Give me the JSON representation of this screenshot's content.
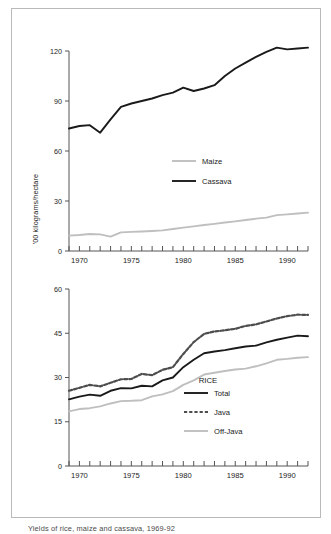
{
  "figure": {
    "ylabel": "'00 kilograms/hectare",
    "caption": "Yields of rice, maize and cassava, 1969-92",
    "border_color": "#b9b9b9",
    "background": "#ffffff"
  },
  "colors": {
    "black": "#1a1a1a",
    "dark_gray": "#4d4d4d",
    "light_gray": "#bfbfbf",
    "axis": "#555555",
    "text": "#222222"
  },
  "chart_data": [
    {
      "type": "line",
      "title": "",
      "xlabel": "",
      "ylabel": "'00 kilograms/hectare",
      "xlim": [
        1969,
        1992
      ],
      "ylim": [
        0,
        120
      ],
      "yticks": [
        0,
        30,
        60,
        90,
        120
      ],
      "xticks_major": [
        1970,
        1975,
        1980,
        1985,
        1990
      ],
      "xticks_minor_step": 1,
      "grid": false,
      "legend_position": "center-right",
      "x": [
        1969,
        1970,
        1971,
        1972,
        1973,
        1974,
        1975,
        1976,
        1977,
        1978,
        1979,
        1980,
        1981,
        1982,
        1983,
        1984,
        1985,
        1986,
        1987,
        1988,
        1989,
        1990,
        1991,
        1992
      ],
      "series": [
        {
          "name": "Cassava",
          "color": "#1a1a1a",
          "style": "solid",
          "values": [
            73.5,
            75.0,
            75.5,
            71.0,
            79.0,
            86.5,
            88.5,
            90.0,
            91.5,
            93.5,
            95.0,
            98.0,
            96.0,
            97.5,
            99.5,
            105.0,
            109.5,
            113.0,
            116.5,
            119.5,
            122.0,
            121.0,
            121.5,
            122.0
          ]
        },
        {
          "name": "Maize",
          "color": "#bfbfbf",
          "style": "solid",
          "values": [
            9.2,
            9.6,
            10.2,
            10.0,
            8.6,
            11.2,
            11.5,
            11.7,
            12.0,
            12.4,
            13.2,
            14.0,
            14.8,
            15.6,
            16.3,
            17.1,
            17.8,
            18.6,
            19.4,
            20.0,
            21.5,
            22.0,
            22.5,
            23.0
          ]
        }
      ],
      "legend": [
        {
          "label": "Maize",
          "color": "#bfbfbf",
          "style": "solid"
        },
        {
          "label": "Cassava",
          "color": "#1a1a1a",
          "style": "solid"
        }
      ]
    },
    {
      "type": "line",
      "title": "RICE",
      "xlabel": "",
      "ylabel": "'00 kilograms/hectare",
      "xlim": [
        1969,
        1992
      ],
      "ylim": [
        0,
        60
      ],
      "yticks": [
        0,
        15,
        30,
        45,
        60
      ],
      "xticks_major": [
        1970,
        1975,
        1980,
        1985,
        1990
      ],
      "xticks_minor_step": 1,
      "grid": false,
      "legend_position": "center-right",
      "x": [
        1969,
        1970,
        1971,
        1972,
        1973,
        1974,
        1975,
        1976,
        1977,
        1978,
        1979,
        1980,
        1981,
        1982,
        1983,
        1984,
        1985,
        1986,
        1987,
        1988,
        1989,
        1990,
        1991,
        1992
      ],
      "series": [
        {
          "name": "Total",
          "color": "#1a1a1a",
          "style": "solid",
          "values": [
            22.6,
            23.5,
            24.2,
            23.8,
            25.5,
            26.4,
            26.3,
            27.2,
            27.0,
            29.0,
            30.0,
            33.5,
            36.0,
            38.2,
            38.8,
            39.3,
            39.9,
            40.5,
            40.8,
            41.9,
            42.8,
            43.5,
            44.2,
            44.0
          ]
        },
        {
          "name": "Java",
          "color": "#4d4d4d",
          "style": "dashed",
          "values": [
            25.5,
            26.5,
            27.5,
            27.0,
            28.2,
            29.4,
            29.5,
            31.2,
            30.8,
            32.6,
            33.5,
            38.0,
            42.0,
            44.8,
            45.6,
            46.0,
            46.5,
            47.5,
            48.0,
            49.0,
            50.0,
            50.8,
            51.3,
            51.2
          ]
        },
        {
          "name": "Off-Java",
          "color": "#bfbfbf",
          "style": "solid",
          "values": [
            18.5,
            19.3,
            19.6,
            20.2,
            21.2,
            22.0,
            22.1,
            22.3,
            23.6,
            24.3,
            25.4,
            27.5,
            29.0,
            31.0,
            31.6,
            32.2,
            32.7,
            33.0,
            33.8,
            34.8,
            36.0,
            36.3,
            36.7,
            36.9
          ]
        }
      ],
      "legend": [
        {
          "label": "Total",
          "color": "#1a1a1a",
          "style": "solid"
        },
        {
          "label": "Java",
          "color": "#4d4d4d",
          "style": "dashed"
        },
        {
          "label": "Off-Java",
          "color": "#bfbfbf",
          "style": "solid"
        }
      ]
    }
  ]
}
